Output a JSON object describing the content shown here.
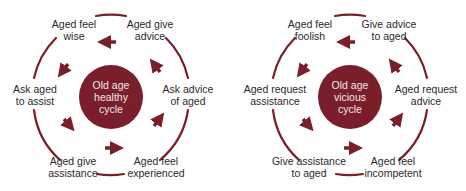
{
  "colors": {
    "accent": "#7a1e2a",
    "text": "#2a2a2a",
    "hub_text": "#f3e6e6"
  },
  "cycles": [
    {
      "hub": [
        "Old age",
        "healthy",
        "cycle"
      ],
      "nodes": {
        "top_left": [
          "Aged feel",
          "wise"
        ],
        "top_right": [
          "Aged give",
          "advice"
        ],
        "right": [
          "Ask advice",
          "of aged"
        ],
        "bottom_right": [
          "Aged feel",
          "experienced"
        ],
        "bottom_left": [
          "Aged give",
          "assistance"
        ],
        "left": [
          "Ask aged",
          "to assist"
        ]
      }
    },
    {
      "hub": [
        "Old age",
        "vicious",
        "cycle"
      ],
      "nodes": {
        "top_left": [
          "Aged feel",
          "foolish"
        ],
        "top_right": [
          "Give advice",
          "to aged"
        ],
        "right": [
          "Aged request",
          "advice"
        ],
        "bottom_right": [
          "Aged feel",
          "incompetent"
        ],
        "bottom_left": [
          "Give assistance",
          "to aged"
        ],
        "left": [
          "Aged request",
          "assistance"
        ]
      }
    }
  ]
}
